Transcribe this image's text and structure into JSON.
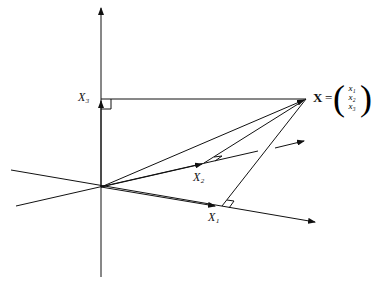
{
  "figure": {
    "labels": {
      "x1": "X₁",
      "x2": "X₂",
      "x3": "X₃",
      "vector": "X",
      "equals": "=",
      "components": [
        "x₁",
        "x₂",
        "x₃"
      ]
    },
    "colors": {
      "ink": "#111111",
      "background": "#ffffff"
    }
  }
}
